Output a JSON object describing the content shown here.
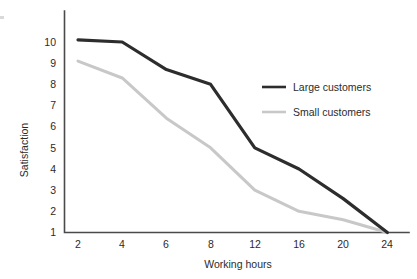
{
  "chart_data": {
    "type": "line",
    "title": "",
    "xlabel": "Working hours",
    "ylabel": "Satisfaction",
    "categories": [
      "2",
      "4",
      "6",
      "8",
      "12",
      "16",
      "20",
      "24"
    ],
    "x": [
      2,
      4,
      6,
      8,
      12,
      16,
      20,
      24
    ],
    "xtick_labels": [
      "2",
      "4",
      "6",
      "8",
      "12",
      "16",
      "20",
      "24"
    ],
    "ytick_labels": [
      "10",
      "9",
      "8",
      "7",
      "6",
      "5",
      "4",
      "3",
      "2",
      "1"
    ],
    "ylim": [
      1,
      10
    ],
    "ylim_labels": [
      1,
      10
    ],
    "grid": false,
    "legend_position": "right-upper",
    "series": [
      {
        "name": "Large customers",
        "color": "#2d2d2d",
        "values": [
          10.1,
          10.0,
          8.7,
          8.0,
          5.0,
          4.0,
          2.6,
          1.0
        ]
      },
      {
        "name": "Small customers",
        "color": "#c8c8c8",
        "values": [
          9.1,
          8.3,
          6.4,
          5.0,
          3.0,
          2.0,
          1.6,
          1.0
        ]
      }
    ]
  },
  "axes": {
    "y_title": "Satisfaction",
    "x_title": "Working hours"
  },
  "legend": {
    "items": [
      {
        "label": "Large customers",
        "color": "#2d2d2d"
      },
      {
        "label": "Small customers",
        "color": "#c8c8c8"
      }
    ]
  },
  "colors": {
    "large": "#2d2d2d",
    "small": "#c8c8c8",
    "axis": "#4a4a4a",
    "text": "#2b2b2b",
    "background": "#ffffff"
  }
}
